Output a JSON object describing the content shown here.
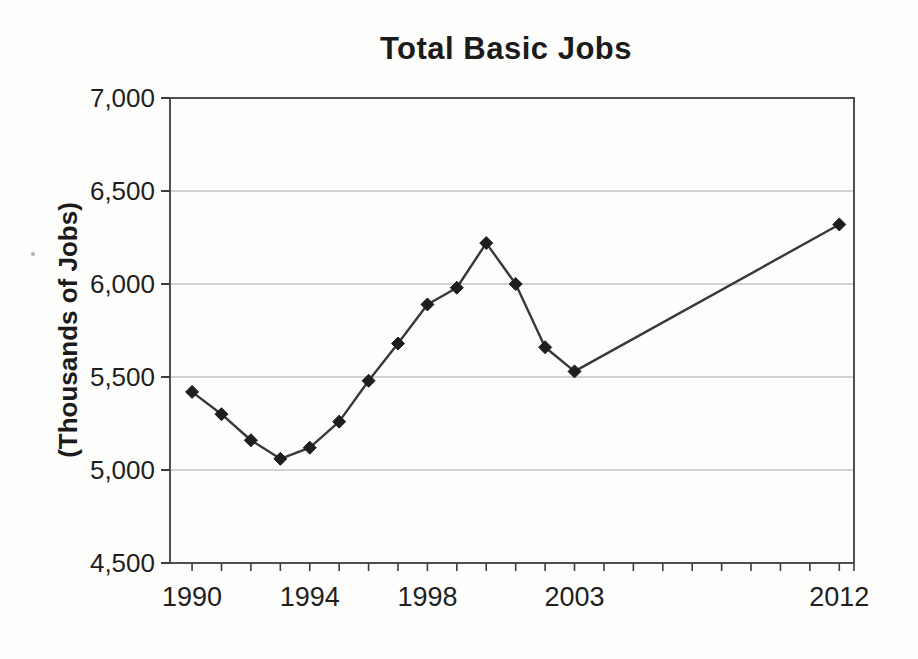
{
  "figure": {
    "kind": "scanned line chart"
  },
  "chart_data": {
    "type": "line",
    "title": "Total Basic Jobs",
    "xlabel": "",
    "ylabel": "(Thousands of Jobs)",
    "legend": "none",
    "grid": "horizontal",
    "ylim": [
      4500,
      7000
    ],
    "xlim": [
      1989.25,
      2012.5
    ],
    "series": [
      {
        "name": "Total Basic Jobs",
        "marker": "diamond",
        "x": [
          1990,
          1991,
          1992,
          1993,
          1994,
          1995,
          1996,
          1997,
          1998,
          1999,
          2000,
          2001,
          2002,
          2003,
          2012
        ],
        "values": [
          5420,
          5300,
          5160,
          5060,
          5120,
          5260,
          5480,
          5680,
          5890,
          5980,
          6220,
          6000,
          5660,
          5530,
          6320
        ]
      }
    ],
    "yticks": [
      {
        "value": 4500,
        "label": "4,500"
      },
      {
        "value": 5000,
        "label": "5,000"
      },
      {
        "value": 5500,
        "label": "5,500"
      },
      {
        "value": 6000,
        "label": "6,000"
      },
      {
        "value": 6500,
        "label": "6,500"
      },
      {
        "value": 7000,
        "label": "7,000"
      }
    ],
    "xticks_labeled": [
      {
        "value": 1990,
        "label": "1990"
      },
      {
        "value": 1994,
        "label": "1994"
      },
      {
        "value": 1998,
        "label": "1998"
      },
      {
        "value": 2003,
        "label": "2003"
      },
      {
        "value": 2012,
        "label": "2012"
      }
    ],
    "xticks_minor": [
      1990,
      1991,
      1992,
      1993,
      1994,
      1995,
      1996,
      1997,
      1998,
      1999,
      2000,
      2001,
      2002,
      2003,
      2004,
      2005,
      2006,
      2007,
      2008,
      2009,
      2010,
      2011,
      2012
    ],
    "colors": {
      "line": "#383838",
      "marker": "#1e1e1e",
      "grid": "#a8a8a8",
      "border": "#4f4f4f",
      "tick": "#3c3c3c",
      "text": "#1f1f1f",
      "background": "#fdfdfc"
    }
  }
}
